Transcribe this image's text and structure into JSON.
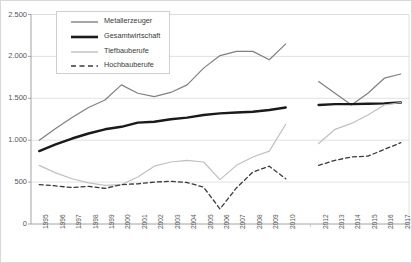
{
  "chart_data": {
    "type": "line",
    "title": "",
    "xlabel": "",
    "ylabel": "",
    "ylim": [
      0,
      2500
    ],
    "yticks": [
      "0",
      "500",
      "1.000",
      "1.500",
      "2.000",
      "2.500"
    ],
    "ytick_values": [
      0,
      500,
      1000,
      1500,
      2000,
      2500
    ],
    "grid": "horizontal",
    "legend_position": "top-left",
    "x": [
      "1995",
      "1996",
      "1997",
      "1998",
      "1999",
      "2000",
      "2001",
      "2002",
      "2003",
      "2004",
      "2005",
      "2006",
      "2007",
      "2008",
      "2009",
      "2010",
      "2011",
      "2012",
      "2013",
      "2014",
      "2015",
      "2016",
      "2017"
    ],
    "xtick_labels": [
      "1995",
      "1996",
      "1997",
      "1998",
      "1999",
      "2000",
      "2001",
      "2002",
      "2003",
      "2004",
      "2005",
      "2006",
      "2007",
      "2008",
      "2009",
      "2010",
      "",
      "2012",
      "2013",
      "2014",
      "2015",
      "2016",
      "2017"
    ],
    "break_after": "2010",
    "break_resume": "2012",
    "series": [
      {
        "name": "Metallerzeuger",
        "color": "#808080",
        "width": 1.2,
        "dash": "none",
        "values": [
          1000,
          1140,
          1270,
          1390,
          1480,
          1660,
          1560,
          1520,
          1570,
          1660,
          1860,
          2010,
          2060,
          2060,
          1960,
          2150,
          null,
          1700,
          1560,
          1420,
          1560,
          1740,
          1790
        ]
      },
      {
        "name": "Gesamtwirtschaft",
        "color": "#1a1a1a",
        "width": 2.4,
        "dash": "none",
        "values": [
          870,
          950,
          1020,
          1080,
          1130,
          1160,
          1210,
          1220,
          1250,
          1270,
          1300,
          1320,
          1330,
          1340,
          1360,
          1390,
          null,
          1420,
          1430,
          1430,
          1435,
          1440,
          1450
        ]
      },
      {
        "name": "Tiefbauberufe",
        "color": "#c0c0c0",
        "width": 1.2,
        "dash": "none",
        "values": [
          700,
          610,
          540,
          490,
          460,
          470,
          560,
          690,
          740,
          760,
          740,
          530,
          700,
          800,
          870,
          1190,
          null,
          960,
          1130,
          1200,
          1300,
          1420,
          1450
        ]
      },
      {
        "name": "Hochbauberufe",
        "color": "#3a3a3a",
        "width": 1.3,
        "dash": "4,3",
        "values": [
          470,
          455,
          435,
          450,
          425,
          470,
          480,
          500,
          510,
          495,
          440,
          180,
          430,
          620,
          690,
          540,
          null,
          700,
          760,
          800,
          810,
          890,
          970
        ]
      }
    ]
  },
  "legend": {
    "items": [
      {
        "label": "Metallerzeuger"
      },
      {
        "label": "Gesamtwirtschaft"
      },
      {
        "label": "Tiefbauberufe"
      },
      {
        "label": "Hochbauberufe"
      }
    ]
  }
}
